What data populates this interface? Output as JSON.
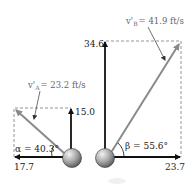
{
  "diagram": {
    "type": "velocity-vector-diagram",
    "ball_A": {
      "velocity_label": "v'A = 23.2 ft/s",
      "velocity_symbol": "v'",
      "velocity_subscript": "A",
      "velocity_value": "= 23.2 ft/s",
      "horizontal_component": "17.7",
      "vertical_component": "15.0",
      "angle_label": "α = 40.3°"
    },
    "ball_B": {
      "velocity_label": "v'B = 41.9 ft/s",
      "velocity_symbol": "v'",
      "velocity_subscript": "B",
      "velocity_value": "= 41.9 ft/s",
      "horizontal_component": "23.7",
      "vertical_component": "34.6",
      "angle_label": "β = 55.6°"
    },
    "colors": {
      "component_arrow": "#111111",
      "resultant_arrow": "#8a8a8a",
      "dashed_box": "#888888",
      "ball_light": "#e8e8e8",
      "ball_dark": "#555555"
    }
  }
}
